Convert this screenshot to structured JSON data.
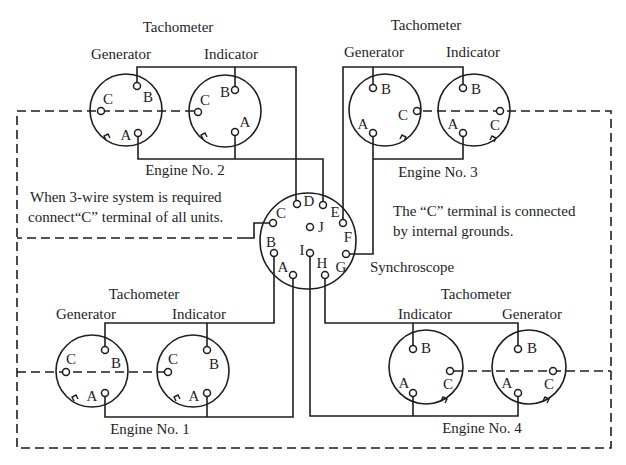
{
  "diagram": {
    "colors": {
      "line": "#1e1e1e",
      "background": "#ffffff"
    },
    "engine_2": {
      "label": "Engine No. 2",
      "tachometer_label": "Tachometer",
      "generator": {
        "label": "Generator",
        "terminals": {
          "A": "A",
          "B": "B",
          "C": "C"
        }
      },
      "indicator": {
        "label": "Indicator",
        "terminals": {
          "A": "A",
          "B": "B",
          "C": "C"
        }
      }
    },
    "engine_3": {
      "label": "Engine No. 3",
      "tachometer_label": "Tachometer",
      "generator": {
        "label": "Generator",
        "terminals": {
          "A": "A",
          "B": "B",
          "C": "C"
        }
      },
      "indicator": {
        "label": "Indicator",
        "terminals": {
          "A": "A",
          "B": "B",
          "C": "C"
        }
      }
    },
    "engine_1": {
      "label": "Engine No. 1",
      "tachometer_label": "Tachometer",
      "generator": {
        "label": "Generator",
        "terminals": {
          "A": "A",
          "B": "B",
          "C": "C"
        }
      },
      "indicator": {
        "label": "Indicator",
        "terminals": {
          "A": "A",
          "B": "B",
          "C": "C"
        }
      }
    },
    "engine_4": {
      "label": "Engine No. 4",
      "tachometer_label": "Tachometer",
      "generator": {
        "label": "Generator",
        "terminals": {
          "A": "A",
          "B": "B",
          "C": "C"
        }
      },
      "indicator": {
        "label": "Indicator",
        "terminals": {
          "A": "A",
          "B": "B",
          "C": "C"
        }
      }
    },
    "synchroscope": {
      "label": "Synchroscope",
      "terminals": {
        "A": "A",
        "B": "B",
        "C": "C",
        "D": "D",
        "E": "E",
        "F": "F",
        "G": "G",
        "H": "H",
        "I": "I",
        "J": "J"
      }
    },
    "notes": {
      "left": [
        "When 3-wire system is required",
        "connect“C” terminal of  all units."
      ],
      "right": [
        "The “C” terminal is connected",
        "by internal grounds."
      ]
    }
  }
}
